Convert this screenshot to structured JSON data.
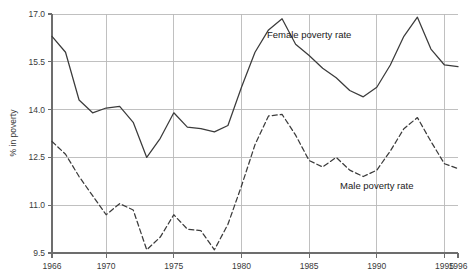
{
  "chart_data": {
    "type": "line",
    "title": "",
    "xlabel": "",
    "ylabel": "% in poverty",
    "xlim": [
      1966,
      1996
    ],
    "ylim": [
      9.5,
      17.0
    ],
    "grid": true,
    "legend_position": "inline-annotation",
    "x_tick_labels": [
      "1966",
      "1970",
      "1975",
      "1980",
      "1985",
      "1990",
      "1995",
      "1996"
    ],
    "x_tick_values": [
      1966,
      1970,
      1975,
      1980,
      1985,
      1990,
      1995,
      1996
    ],
    "y_tick_labels": [
      "17.0",
      "15.5",
      "14.0",
      "12.5",
      "11.0",
      "9.5"
    ],
    "y_tick_values": [
      17.0,
      15.5,
      14.0,
      12.5,
      11.0,
      9.5
    ],
    "x": [
      1966,
      1967,
      1968,
      1969,
      1970,
      1971,
      1972,
      1973,
      1974,
      1975,
      1976,
      1977,
      1978,
      1979,
      1980,
      1981,
      1982,
      1983,
      1984,
      1985,
      1986,
      1987,
      1988,
      1989,
      1990,
      1991,
      1992,
      1993,
      1994,
      1995,
      1996
    ],
    "series": [
      {
        "name": "Female poverty rate",
        "style": "solid",
        "color": "#3b3b3b",
        "annotation": "Female poverty rate",
        "values": [
          16.3,
          15.8,
          14.3,
          13.9,
          14.05,
          14.1,
          13.6,
          12.5,
          13.1,
          13.9,
          13.45,
          13.4,
          13.3,
          13.5,
          14.7,
          15.8,
          16.5,
          16.85,
          16.05,
          15.7,
          15.3,
          15.0,
          14.6,
          14.4,
          14.7,
          15.4,
          16.3,
          16.9,
          15.9,
          15.4,
          15.35
        ]
      },
      {
        "name": "Male poverty rate",
        "style": "dashed",
        "color": "#3b3b3b",
        "annotation": "Male poverty rate",
        "values": [
          13.0,
          12.6,
          11.9,
          11.3,
          10.7,
          11.05,
          10.85,
          9.6,
          10.0,
          10.7,
          10.25,
          10.2,
          9.6,
          10.4,
          11.6,
          12.9,
          13.8,
          13.85,
          13.2,
          12.4,
          12.2,
          12.5,
          12.1,
          11.9,
          12.1,
          12.7,
          13.4,
          13.75,
          13.0,
          12.3,
          12.15
        ]
      }
    ],
    "annotations": [
      {
        "text": "Female poverty rate",
        "x": 1985,
        "y": 16.25
      },
      {
        "text": "Male poverty rate",
        "x": 1990,
        "y": 11.5
      }
    ]
  }
}
